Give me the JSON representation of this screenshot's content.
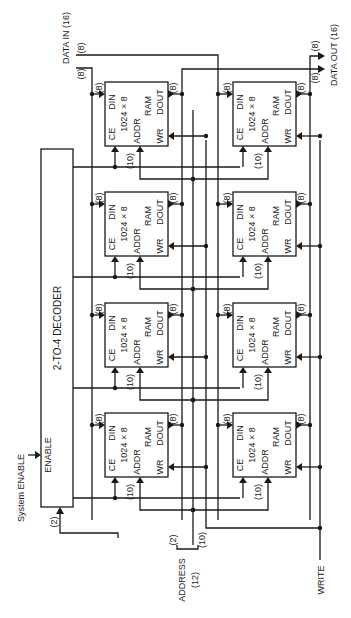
{
  "diagram": {
    "type": "memory-organization-schematic",
    "orientation": "rotated-90-ccw",
    "decoder": {
      "title": "2-TO-4 DECODER",
      "enable_label": "ENABLE",
      "input_width": "(2)"
    },
    "inputs": {
      "system_enable": "System ENABLE",
      "data_in": "DATA IN (16)",
      "data_in_width_a": "(8)",
      "data_in_width_b": "(8)",
      "address": "ADDRESS",
      "address_width": "(12)",
      "address_split_high": "(2)",
      "address_split_low": "(10)",
      "write": "WRITE"
    },
    "outputs": {
      "data_out": "DATA OUT (16)",
      "data_out_width_a": "(8)",
      "data_out_width_b": "(8)"
    },
    "ram_chip": {
      "ce": "CE",
      "din": "DIN",
      "size": "1024 × 8",
      "addr": "ADDR",
      "ram": "RAM",
      "wr": "WR",
      "dout": "DOUT",
      "din_width": "(8)",
      "dout_width": "(8)",
      "addr_width": "(10)"
    },
    "chips": [
      {
        "row": 0,
        "col": 0
      },
      {
        "row": 0,
        "col": 1
      },
      {
        "row": 1,
        "col": 0
      },
      {
        "row": 1,
        "col": 1
      },
      {
        "row": 2,
        "col": 0
      },
      {
        "row": 2,
        "col": 1
      },
      {
        "row": 3,
        "col": 0
      },
      {
        "row": 3,
        "col": 1
      }
    ]
  }
}
